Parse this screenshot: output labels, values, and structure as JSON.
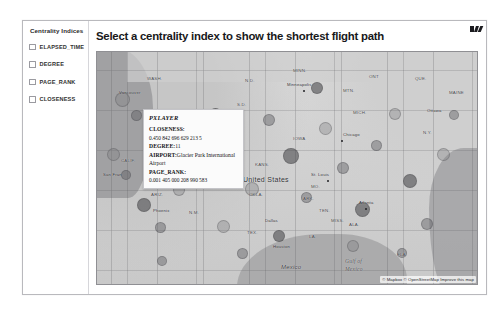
{
  "top_strip": {
    "text": ""
  },
  "sidebar": {
    "title": "Centrality Indices",
    "items": [
      {
        "label": "ELAPSED_TIME",
        "checked": false
      },
      {
        "label": "DEGREE",
        "checked": false
      },
      {
        "label": "PAGE_RANK",
        "checked": false
      },
      {
        "label": "CLOSENESS",
        "checked": false
      }
    ]
  },
  "header": {
    "title": "Select a centrality index to show the shortest flight path",
    "window_icons": [
      "minimize-icon",
      "maximize-icon",
      "close-icon"
    ]
  },
  "map": {
    "labels": {
      "country_us": "United States",
      "country_mx": "Mexico",
      "country_ca": "ONT",
      "water_gulf_1": "Gulf of",
      "water_gulf_2": "Mexico",
      "city_vancouver": "Vancouver",
      "city_minneapolis": "Minneapolis",
      "city_chicago": "Chicago",
      "city_st_louis": "St. Louis",
      "city_atlanta": "Atlanta",
      "city_dallas": "Dallas",
      "city_houston": "Houston",
      "city_phoenix": "Phoenix",
      "city_ottawa": "Ottawa",
      "city_san_francisco": "San Fran"
    },
    "states": [
      "WASH.",
      "N.D.",
      "MINN.",
      "MTN.",
      "S.D.",
      "NEBR.",
      "IOWA",
      "CALIF.",
      "COLO.",
      "KANS.",
      "MO.",
      "ARIZ.",
      "OKLA.",
      "ARK.",
      "TEN.",
      "MISS.",
      "ALA.",
      "N.M.",
      "TEX.",
      "LA.",
      "FLA.",
      "MICH.",
      "QUE.",
      "MAINE",
      "N.Y."
    ],
    "attribution": "© Mapbox © OpenStreetMap Improve this map"
  },
  "tooltip": {
    "title": "PXLAYER",
    "rows": [
      {
        "key": "CLOSENESS:",
        "value": "0.450 842 696 629 213 5",
        "inline": false
      },
      {
        "key": "DEGREE:",
        "value": "11",
        "inline": true
      },
      {
        "key": "AIRPORT:",
        "value": "Glacier Park International Airport",
        "inline": true
      },
      {
        "key": "PAGE_RANK:",
        "value": "0.001 405 000 208 990 583",
        "inline": false
      }
    ]
  },
  "caption": {
    "text": ""
  }
}
